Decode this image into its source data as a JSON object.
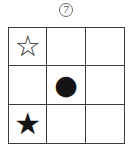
{
  "colors": {
    "ink": "#3d3d3d",
    "symbol": "#141414",
    "background": "#ffffff"
  },
  "header": {
    "item_number": "7"
  },
  "grid": {
    "rows": 3,
    "cols": 3,
    "cells": [
      [
        {
          "symbol": "open-star",
          "glyph": "☆"
        },
        {
          "symbol": "none",
          "glyph": ""
        },
        {
          "symbol": "none",
          "glyph": ""
        }
      ],
      [
        {
          "symbol": "none",
          "glyph": ""
        },
        {
          "symbol": "filled-circle",
          "glyph": "●"
        },
        {
          "symbol": "none",
          "glyph": ""
        }
      ],
      [
        {
          "symbol": "filled-star",
          "glyph": "★"
        },
        {
          "symbol": "none",
          "glyph": ""
        },
        {
          "symbol": "none",
          "glyph": ""
        }
      ]
    ]
  }
}
